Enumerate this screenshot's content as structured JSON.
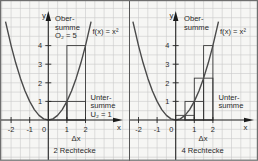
{
  "colors": {
    "background": "#f6f6f4",
    "grid": "#c9c9c9",
    "lines": "#262626"
  },
  "panels": [
    {
      "y_axis_label": "y",
      "x_axis_label": "x",
      "upper_sum_label": {
        "line1": "Ober-",
        "line2": "summe",
        "line3": "O₂ = 5"
      },
      "lower_sum_label": {
        "line1": "Unter-",
        "line2": "summe",
        "line3": "U₂ = 1"
      },
      "function_label": "f(x) = x²",
      "delta_label": "Δx",
      "caption": "2 Rechtecke",
      "x_tick_labels": [
        "-2",
        "-1",
        "0",
        "1",
        "2"
      ],
      "y_tick_labels": [
        "1",
        "2",
        "3",
        "4"
      ]
    },
    {
      "y_axis_label": "y",
      "x_axis_label": "x",
      "upper_sum_label": {
        "line1": "Ober-",
        "line2": "summe"
      },
      "lower_sum_label": {
        "line1": "Unter-",
        "line2": "summe"
      },
      "function_label": "f(x) = x²",
      "delta_label": "Δx",
      "caption": "4 Rechtecke",
      "x_tick_labels": [
        "-2",
        "-1",
        "0",
        "1",
        "2"
      ],
      "y_tick_labels": [
        "1",
        "2",
        "3",
        "4"
      ]
    }
  ],
  "chart_data": [
    {
      "type": "line",
      "title": "2 Rechtecke",
      "xlabel": "x",
      "ylabel": "y",
      "function": "f(x) = x²",
      "grid": true,
      "x_ticks": [
        -2,
        -1,
        0,
        1,
        2
      ],
      "y_ticks": [
        1,
        2,
        3,
        4
      ],
      "series": [
        {
          "name": "f(x) = x²",
          "x": [
            -2.3,
            -2.0,
            -1.75,
            -1.5,
            -1.25,
            -1.0,
            -0.75,
            -0.5,
            -0.25,
            0,
            0.25,
            0.5,
            0.75,
            1.0,
            1.25,
            1.5,
            1.75,
            2.0,
            2.3
          ],
          "y": [
            5.29,
            4,
            3.06,
            2.25,
            1.56,
            1,
            0.56,
            0.25,
            0.06,
            0,
            0.06,
            0.25,
            0.56,
            1,
            1.56,
            2.25,
            3.06,
            4,
            5.29
          ]
        }
      ],
      "rectangles": {
        "delta_x": 1,
        "intervals": [
          [
            0,
            1
          ],
          [
            1,
            2
          ]
        ],
        "obersumme_heights": [
          1,
          4
        ],
        "untersumme_heights": [
          0,
          1
        ]
      },
      "annotations": [
        "Obersumme O₂ = 5",
        "Untersumme U₂ = 1",
        "Δx"
      ]
    },
    {
      "type": "line",
      "title": "4 Rechtecke",
      "xlabel": "x",
      "ylabel": "y",
      "function": "f(x) = x²",
      "grid": true,
      "x_ticks": [
        -2,
        -1,
        0,
        1,
        2
      ],
      "y_ticks": [
        1,
        2,
        3,
        4
      ],
      "series": [
        {
          "name": "f(x) = x²",
          "x": [
            -2.3,
            -2.0,
            -1.75,
            -1.5,
            -1.25,
            -1.0,
            -0.75,
            -0.5,
            -0.25,
            0,
            0.25,
            0.5,
            0.75,
            1.0,
            1.25,
            1.5,
            1.75,
            2.0,
            2.3
          ],
          "y": [
            5.29,
            4,
            3.06,
            2.25,
            1.56,
            1,
            0.56,
            0.25,
            0.06,
            0,
            0.06,
            0.25,
            0.56,
            1,
            1.56,
            2.25,
            3.06,
            4,
            5.29
          ]
        }
      ],
      "rectangles": {
        "delta_x": 0.5,
        "intervals": [
          [
            0,
            0.5
          ],
          [
            0.5,
            1
          ],
          [
            1,
            1.5
          ],
          [
            1.5,
            2
          ]
        ],
        "obersumme_heights": [
          0.25,
          1,
          2.25,
          4
        ],
        "untersumme_heights": [
          0,
          0.25,
          1,
          2.25
        ]
      },
      "annotations": [
        "Obersumme",
        "Untersumme",
        "Δx"
      ]
    }
  ]
}
